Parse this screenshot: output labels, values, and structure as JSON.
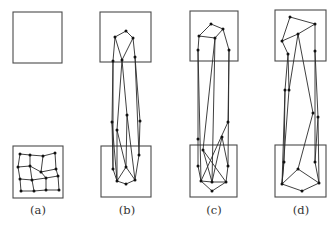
{
  "figure": {
    "panels": [
      {
        "id": "a",
        "label": "(a)",
        "label_x": 38,
        "top_box": [
          13,
          12,
          49,
          51
        ],
        "bottom_box": [
          13,
          146,
          50,
          52
        ],
        "nodes": [
          [
            20,
            154
          ],
          [
            30,
            155
          ],
          [
            43,
            156
          ],
          [
            55,
            153
          ],
          [
            18,
            167
          ],
          [
            30,
            166
          ],
          [
            41,
            172
          ],
          [
            56,
            169
          ],
          [
            20,
            179
          ],
          [
            32,
            180
          ],
          [
            46,
            178
          ],
          [
            58,
            176
          ],
          [
            21,
            191
          ],
          [
            34,
            191
          ],
          [
            46,
            190
          ],
          [
            59,
            190
          ]
        ],
        "edges": [
          [
            0,
            1
          ],
          [
            1,
            2
          ],
          [
            2,
            3
          ],
          [
            4,
            5
          ],
          [
            5,
            6
          ],
          [
            6,
            7
          ],
          [
            8,
            9
          ],
          [
            9,
            10
          ],
          [
            10,
            11
          ],
          [
            12,
            13
          ],
          [
            13,
            14
          ],
          [
            14,
            15
          ],
          [
            0,
            4
          ],
          [
            4,
            8
          ],
          [
            8,
            12
          ],
          [
            1,
            5
          ],
          [
            5,
            9
          ],
          [
            9,
            13
          ],
          [
            2,
            6
          ],
          [
            6,
            10
          ],
          [
            10,
            14
          ],
          [
            3,
            7
          ],
          [
            7,
            11
          ],
          [
            11,
            15
          ]
        ]
      },
      {
        "id": "b",
        "label": "(b)",
        "label_x": 127,
        "top_box": [
          100,
          12,
          51,
          50
        ],
        "bottom_box": [
          101,
          146,
          50,
          51
        ],
        "nodes": [
          [
            126,
            31
          ],
          [
            115,
            37
          ],
          [
            133,
            38
          ],
          [
            113,
            61
          ],
          [
            122,
            60
          ],
          [
            135,
            57
          ],
          [
            112,
            122
          ],
          [
            117,
            130
          ],
          [
            140,
            121
          ],
          [
            127,
            115
          ],
          [
            113,
            169
          ],
          [
            126,
            167
          ],
          [
            139,
            155
          ],
          [
            117,
            181
          ],
          [
            126,
            184
          ],
          [
            135,
            180
          ]
        ],
        "edges": [
          [
            0,
            1
          ],
          [
            0,
            2
          ],
          [
            1,
            4
          ],
          [
            2,
            4
          ],
          [
            1,
            3
          ],
          [
            2,
            5
          ],
          [
            3,
            10
          ],
          [
            3,
            6
          ],
          [
            4,
            7
          ],
          [
            4,
            9
          ],
          [
            5,
            8
          ],
          [
            5,
            12
          ],
          [
            6,
            13
          ],
          [
            7,
            11
          ],
          [
            9,
            11
          ],
          [
            8,
            12
          ],
          [
            7,
            13
          ],
          [
            9,
            15
          ],
          [
            10,
            13
          ],
          [
            11,
            13
          ],
          [
            11,
            15
          ],
          [
            13,
            14
          ],
          [
            14,
            15
          ],
          [
            12,
            15
          ],
          [
            6,
            10
          ]
        ]
      },
      {
        "id": "c",
        "label": "(c)",
        "label_x": 214,
        "top_box": [
          190,
          11,
          48,
          50
        ],
        "bottom_box": [
          190,
          145,
          47,
          52
        ],
        "nodes": [
          [
            211,
            24
          ],
          [
            223,
            29
          ],
          [
            199,
            36
          ],
          [
            215,
            38
          ],
          [
            198,
            50
          ],
          [
            229,
            50
          ],
          [
            198,
            139
          ],
          [
            203,
            150
          ],
          [
            222,
            137
          ],
          [
            228,
            122
          ],
          [
            198,
            166
          ],
          [
            228,
            166
          ],
          [
            201,
            181
          ],
          [
            212,
            182
          ],
          [
            226,
            182
          ],
          [
            212,
            191
          ]
        ],
        "edges": [
          [
            0,
            2
          ],
          [
            0,
            1
          ],
          [
            2,
            3
          ],
          [
            1,
            3
          ],
          [
            1,
            5
          ],
          [
            2,
            4
          ],
          [
            4,
            6
          ],
          [
            4,
            12
          ],
          [
            3,
            7
          ],
          [
            3,
            13
          ],
          [
            5,
            9
          ],
          [
            5,
            11
          ],
          [
            7,
            14
          ],
          [
            9,
            12
          ],
          [
            6,
            10
          ],
          [
            8,
            11
          ],
          [
            7,
            13
          ],
          [
            8,
            13
          ],
          [
            10,
            12
          ],
          [
            11,
            14
          ],
          [
            12,
            13
          ],
          [
            13,
            14
          ],
          [
            12,
            15
          ],
          [
            14,
            15
          ]
        ]
      },
      {
        "id": "d",
        "label": "(d)",
        "label_x": 301,
        "top_box": [
          275,
          10,
          51,
          51
        ],
        "bottom_box": [
          275,
          145,
          51,
          52
        ],
        "nodes": [
          [
            290,
            17
          ],
          [
            315,
            24
          ],
          [
            282,
            41
          ],
          [
            298,
            34
          ],
          [
            288,
            54
          ],
          [
            315,
            51
          ],
          [
            285,
            90
          ],
          [
            289,
            90
          ],
          [
            313,
            113
          ],
          [
            318,
            117
          ],
          [
            284,
            162
          ],
          [
            315,
            162
          ],
          [
            298,
            169
          ],
          [
            282,
            184
          ],
          [
            319,
            183
          ],
          [
            302,
            191
          ]
        ],
        "edges": [
          [
            0,
            2
          ],
          [
            0,
            1
          ],
          [
            2,
            3
          ],
          [
            1,
            3
          ],
          [
            2,
            4
          ],
          [
            1,
            5
          ],
          [
            4,
            6
          ],
          [
            4,
            7
          ],
          [
            3,
            7
          ],
          [
            3,
            8
          ],
          [
            5,
            9
          ],
          [
            5,
            11
          ],
          [
            6,
            10
          ],
          [
            7,
            13
          ],
          [
            8,
            12
          ],
          [
            9,
            11
          ],
          [
            6,
            13
          ],
          [
            9,
            14
          ],
          [
            10,
            13
          ],
          [
            12,
            13
          ],
          [
            12,
            14
          ],
          [
            13,
            15
          ],
          [
            14,
            15
          ],
          [
            11,
            14
          ]
        ]
      }
    ]
  }
}
